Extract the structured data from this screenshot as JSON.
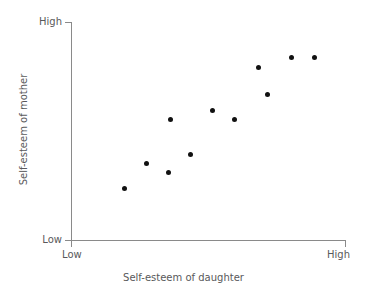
{
  "chart_data": {
    "type": "scatter",
    "title": "",
    "xlabel": "Self-esteem of daughter",
    "ylabel": "Self-esteem of mother",
    "grid": false,
    "legend": null,
    "xlim": [
      0,
      100
    ],
    "ylim": [
      0,
      100
    ],
    "x_tick_labels": [
      "Low",
      "High"
    ],
    "y_tick_labels": [
      "Low",
      "High"
    ],
    "x_axis_low_label": "Low",
    "x_axis_high_label": "High",
    "y_axis_low_label": "Low",
    "y_axis_high_label": "High",
    "point_color": "#111111",
    "axis_color": "#8a8a8a",
    "text_color": "#59595b",
    "n_points": 11,
    "relationship": "positive",
    "points": [
      {
        "x": 19.3,
        "y": 24.2
      },
      {
        "x": 27.6,
        "y": 35.6
      },
      {
        "x": 35.6,
        "y": 31.5
      },
      {
        "x": 43.6,
        "y": 39.3
      },
      {
        "x": 36.0,
        "y": 55.3
      },
      {
        "x": 51.3,
        "y": 59.4
      },
      {
        "x": 59.6,
        "y": 55.3
      },
      {
        "x": 68.0,
        "y": 79.0
      },
      {
        "x": 71.6,
        "y": 67.1
      },
      {
        "x": 80.0,
        "y": 83.6
      },
      {
        "x": 88.4,
        "y": 83.6
      }
    ]
  }
}
